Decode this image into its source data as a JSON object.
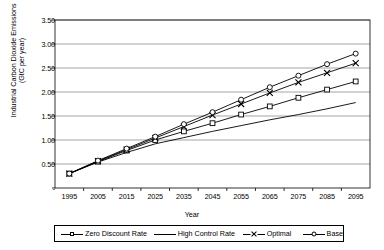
{
  "chart_data": {
    "type": "line",
    "title": "",
    "xlabel": "Year",
    "ylabel": "Industrial Carbon Dioxide Emissions\n(GtC per year)",
    "x": [
      1995,
      2005,
      2015,
      2025,
      2035,
      2045,
      2055,
      2065,
      2075,
      2085,
      2095
    ],
    "xlim": [
      1990,
      2100
    ],
    "ylim": [
      0,
      3.5
    ],
    "ytick_labels": [
      "-",
      "0.50",
      "1.00",
      "1.50",
      "2.00",
      "2.50",
      "3.00",
      "3.50"
    ],
    "ytick_values": [
      0,
      0.5,
      1.0,
      1.5,
      2.0,
      2.5,
      3.0,
      3.5
    ],
    "xtick_labels": [
      "1995",
      "2005",
      "2015",
      "2025",
      "2035",
      "2045",
      "2055",
      "2065",
      "2075",
      "2085",
      "2095"
    ],
    "grid": "horizontal",
    "legend_position": "below-plot",
    "series": [
      {
        "name": "Zero Discount Rate",
        "marker": "square",
        "values": [
          0.3,
          0.55,
          0.78,
          1.0,
          1.18,
          1.35,
          1.53,
          1.7,
          1.88,
          2.05,
          2.22
        ]
      },
      {
        "name": "High Control Rate",
        "marker": "none",
        "values": [
          0.3,
          0.54,
          0.74,
          0.92,
          1.05,
          1.18,
          1.3,
          1.42,
          1.53,
          1.65,
          1.78
        ]
      },
      {
        "name": "Optimal",
        "marker": "x",
        "values": [
          0.3,
          0.56,
          0.8,
          1.04,
          1.28,
          1.52,
          1.75,
          1.98,
          2.2,
          2.4,
          2.6
        ]
      },
      {
        "name": "Base",
        "marker": "circle",
        "values": [
          0.3,
          0.57,
          0.82,
          1.07,
          1.33,
          1.58,
          1.84,
          2.1,
          2.34,
          2.58,
          2.8
        ]
      }
    ]
  },
  "colors": {
    "axis": "#000000",
    "grid": "#808080",
    "series": "#000000",
    "background": "#ffffff"
  }
}
